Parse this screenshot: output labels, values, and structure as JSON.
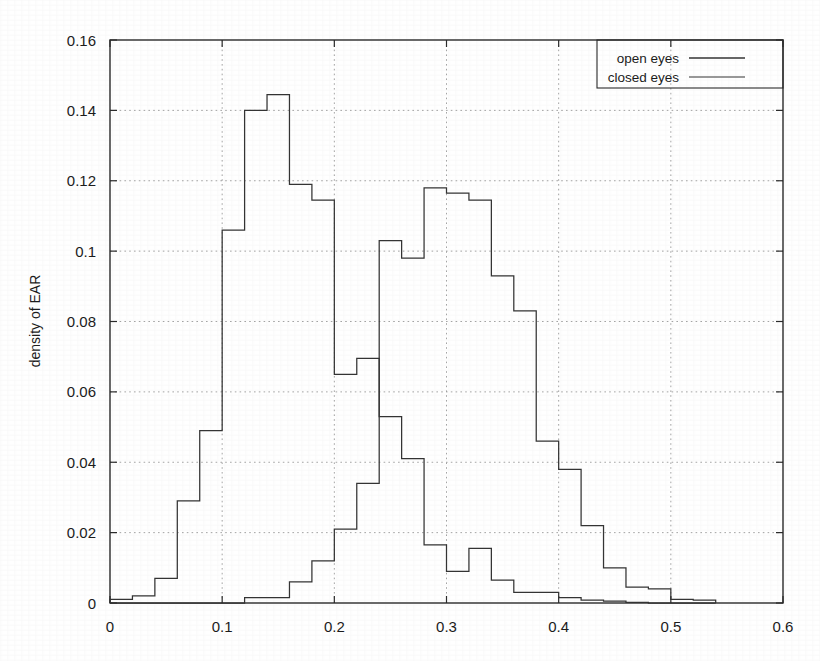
{
  "chart_data": {
    "type": "line",
    "title": "",
    "subtitle": "",
    "xlabel": "",
    "ylabel": "density of EAR",
    "xlim": [
      0,
      0.6
    ],
    "ylim": [
      0,
      0.16
    ],
    "xticks": [
      "0",
      "0.1",
      "0.2",
      "0.3",
      "0.4",
      "0.5",
      "0.6"
    ],
    "xtick_values": [
      0,
      0.1,
      0.2,
      0.3,
      0.4,
      0.5,
      0.6
    ],
    "yticks": [
      "0",
      "0.02",
      "0.04",
      "0.06",
      "0.08",
      "0.1",
      "0.12",
      "0.14",
      "0.16"
    ],
    "ytick_values": [
      0,
      0.02,
      0.04,
      0.06,
      0.08,
      0.1,
      0.12,
      0.14,
      0.16
    ],
    "grid": true,
    "grid_style": "dotted",
    "legend_position": "top-right",
    "bin_width": 0.02,
    "bin_edges": [
      0.0,
      0.02,
      0.04,
      0.06,
      0.08,
      0.1,
      0.12,
      0.14,
      0.16,
      0.18,
      0.2,
      0.22,
      0.24,
      0.26,
      0.28,
      0.3,
      0.32,
      0.34,
      0.36,
      0.38,
      0.4,
      0.42,
      0.44,
      0.46,
      0.48,
      0.5,
      0.52,
      0.54
    ],
    "series": [
      {
        "name": "closed eyes",
        "color": "#333333",
        "style": "step-histogram",
        "values": [
          0.001,
          0.002,
          0.007,
          0.029,
          0.049,
          0.106,
          0.14,
          0.1445,
          0.119,
          0.1145,
          0.065,
          0.0695,
          0.053,
          0.041,
          0.0165,
          0.009,
          0.0155,
          0.0065,
          0.003,
          0.003,
          0.0015,
          0.0008,
          0.0005,
          0.0002,
          0.0,
          0.0,
          0.0
        ]
      },
      {
        "name": "open eyes",
        "color": "#333333",
        "style": "step-histogram",
        "values": [
          0.0,
          0.0,
          0.0,
          0.0,
          0.0,
          0.0,
          0.0015,
          0.0015,
          0.006,
          0.012,
          0.021,
          0.034,
          0.103,
          0.098,
          0.118,
          0.1165,
          0.1145,
          0.093,
          0.083,
          0.046,
          0.038,
          0.022,
          0.01,
          0.0045,
          0.004,
          0.001,
          0.0008
        ]
      }
    ],
    "legend": [
      {
        "label": "open eyes",
        "color": "#333333"
      },
      {
        "label": "closed eyes",
        "color": "#333333"
      }
    ]
  },
  "figure": {
    "background_color": "#ffffff",
    "axis_color": "#2a2a2a",
    "grid_color": "#9a9a9a"
  }
}
